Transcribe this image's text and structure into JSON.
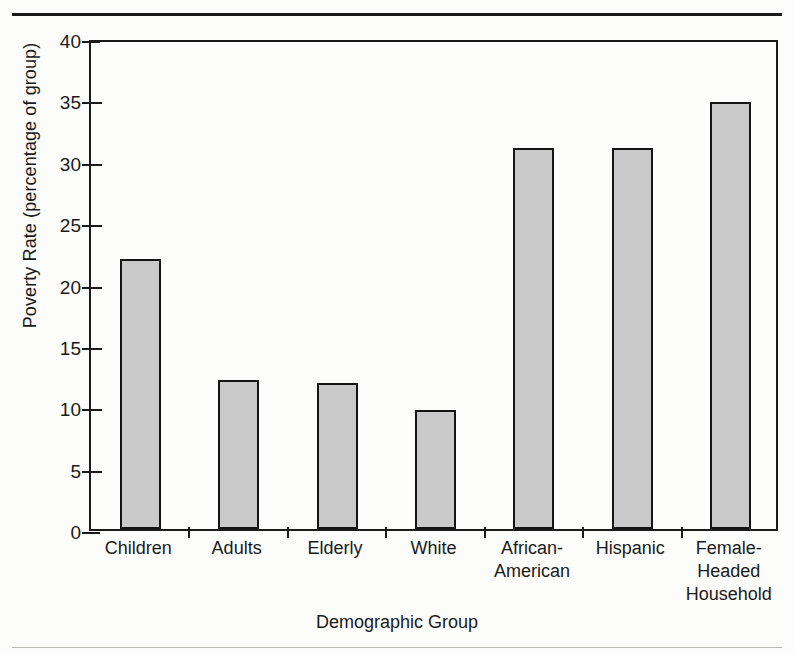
{
  "figure": {
    "background_color": "#fcfcfa",
    "rule_color": "#1a1a1a",
    "axis_color": "#1a1a1a",
    "bar_fill_color": "#c9c9c9",
    "bar_edge_color": "#141414"
  },
  "chart_data": {
    "type": "bar",
    "title": "",
    "xlabel": "Demographic Group",
    "ylabel": "Poverty Rate (percentage of group)",
    "ylim": [
      0,
      40
    ],
    "yticks": [
      0,
      5,
      10,
      15,
      20,
      25,
      30,
      35,
      40
    ],
    "ytick_labels": [
      "0",
      "5",
      "10",
      "15",
      "20",
      "25",
      "30",
      "35",
      "40"
    ],
    "grid": false,
    "legend": null,
    "categories": [
      "Children",
      "Adults",
      "Elderly",
      "White",
      "African-\nAmerican",
      "Hispanic",
      "Female-\nHeaded\nHousehold"
    ],
    "category_labels_flat": [
      "Children",
      "Adults",
      "Elderly",
      "White",
      "African-American",
      "Hispanic",
      "Female-Headed Household"
    ],
    "values": [
      22.0,
      12.1,
      11.9,
      9.7,
      31.0,
      31.0,
      34.8
    ],
    "value_unit": "percent"
  }
}
